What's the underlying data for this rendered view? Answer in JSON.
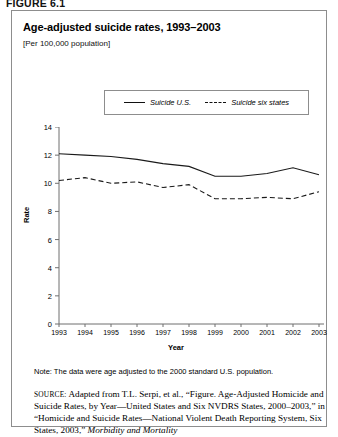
{
  "figure": {
    "number": "FIGURE 6.1"
  },
  "header": {
    "title": "Age-adjusted suicide rates, 1993–2003",
    "subtitle": "[Per 100,000 population]"
  },
  "legend": {
    "items": [
      {
        "label": "Suicide U.S.",
        "style": "solid",
        "icon": "solid-line-icon"
      },
      {
        "label": "Suicide six states",
        "style": "dashed",
        "icon": "dashed-line-icon"
      }
    ]
  },
  "footer": {
    "note": "Note: The data were age adjusted to the 2000 standard U.S. population.",
    "source_keyword": "SOURCE:",
    "source_text_1": " Adapted from T.L. Serpi, et al., “Figure. Age-Adjusted Homicide and Suicide Rates, by Year—United States and Six NVDRS States, 2000–2003,” in “Homicide and Suicide Rates—National Violent Death Reporting System, Six States, 2003,” ",
    "source_italic": "Morbidity and Mortality"
  },
  "chart_data": {
    "type": "line",
    "title": "Age-adjusted suicide rates, 1993–2003",
    "subtitle": "[Per 100,000 population]",
    "xlabel": "Year",
    "ylabel": "Rate",
    "categories": [
      "1993",
      "1994",
      "1995",
      "1996",
      "1997",
      "1998",
      "1999",
      "2000",
      "2001",
      "2002",
      "2003"
    ],
    "xticklabels": [
      "1993",
      "1994",
      "1995",
      "1996",
      "1997",
      "1998",
      "1999",
      "2000",
      "2001",
      "2002",
      "2003"
    ],
    "yticklabels": [
      "0",
      "2",
      "4",
      "6",
      "8",
      "10",
      "12",
      "14"
    ],
    "ylim": [
      0,
      14
    ],
    "ytick_step": 2,
    "grid": false,
    "legend_position": "top-center",
    "series": [
      {
        "name": "Suicide U.S.",
        "style": "solid",
        "values": [
          12.1,
          12.0,
          11.9,
          11.7,
          11.4,
          11.2,
          10.5,
          10.5,
          10.7,
          11.1,
          10.6
        ]
      },
      {
        "name": "Suicide six states",
        "style": "dashed",
        "values": [
          10.2,
          10.4,
          10.0,
          10.1,
          9.7,
          9.9,
          8.9,
          8.9,
          9.0,
          8.9,
          9.4
        ]
      }
    ]
  }
}
